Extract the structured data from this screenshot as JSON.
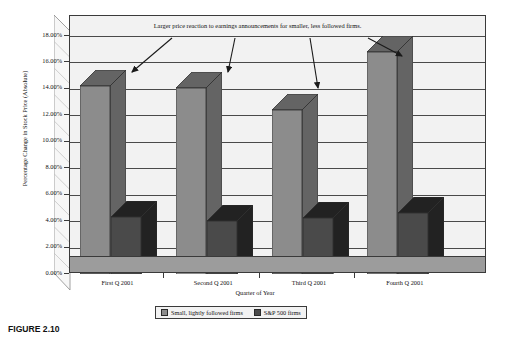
{
  "chart_data": {
    "type": "bar",
    "title": "",
    "annotation": "Larger price reaction to earnings announcements for smaller, less followed firms.",
    "xlabel": "Quarter of Year",
    "ylabel": "Percentage Change in Stock Price (Absolute)",
    "categories": [
      "First Q  2001",
      "Second Q 2001",
      "Third Q 2001",
      "Fourth Q 2001"
    ],
    "series": [
      {
        "name": "Small, lightly followed firms",
        "color": "#8c8c8c",
        "values": [
          14.2,
          14.1,
          12.4,
          16.8
        ]
      },
      {
        "name": "S&P 500 firms",
        "color": "#4a4a4a",
        "values": [
          4.3,
          4.0,
          4.2,
          4.6
        ]
      }
    ],
    "ylim": [
      0,
      18
    ],
    "ytick_step": 2,
    "yticks": [
      "0.00%",
      "2.00%",
      "4.00%",
      "6.00%",
      "8.00%",
      "10.00%",
      "12.00%",
      "14.00%",
      "16.00%",
      "18.00%"
    ],
    "grid": true,
    "legend_position": "bottom"
  },
  "figure": {
    "caption": "FIGURE 2.10"
  }
}
